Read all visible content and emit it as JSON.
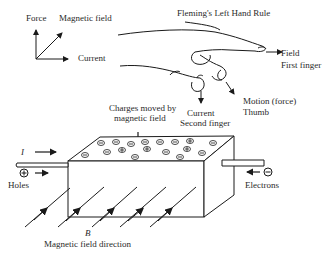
{
  "diagram": {
    "title": "Fleming's Left Hand Rule",
    "axes_legend": {
      "force": "Force",
      "magnetic_field": "Magnetic field",
      "current": "Current"
    },
    "hand_labels": {
      "field": "Field",
      "field_finger": "First finger",
      "motion": "Motion (force)",
      "motion_finger": "Thumb",
      "current": "Current",
      "current_finger": "Second finger"
    },
    "block_labels": {
      "charges": "Charges moved by",
      "charges_line2": "magnetic field",
      "current_symbol": "I",
      "holes": "Holes",
      "holes_symbol": "+",
      "electrons": "Electrons",
      "electrons_symbol": "−",
      "b_symbol": "B",
      "field_direction": "Magnetic field direction"
    },
    "charges_on_top": {
      "negative_count": 15,
      "positive_count": 4
    },
    "colors": {
      "line": "#1a1a1a",
      "background": "#ffffff"
    }
  }
}
